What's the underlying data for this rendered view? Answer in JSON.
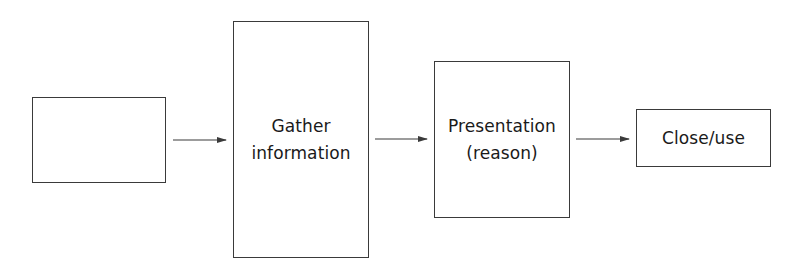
{
  "diagram": {
    "type": "flowchart",
    "direction": "left-to-right",
    "nodes": [
      {
        "id": "start",
        "label": ""
      },
      {
        "id": "gather",
        "label": "Gather\ninformation"
      },
      {
        "id": "presentation",
        "label": "Presentation\n(reason)"
      },
      {
        "id": "close",
        "label": "Close/use"
      }
    ],
    "edges": [
      {
        "from": "start",
        "to": "gather"
      },
      {
        "from": "gather",
        "to": "presentation"
      },
      {
        "from": "presentation",
        "to": "close"
      }
    ],
    "colors": {
      "stroke": "#3a3a3a",
      "background": "#ffffff",
      "text": "#1a1a1a"
    }
  }
}
